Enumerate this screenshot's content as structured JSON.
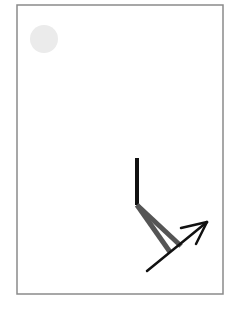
{
  "diagram": {
    "background": "#ffffff",
    "frame": {
      "x": 17,
      "y": 5,
      "width": 206,
      "height": 289,
      "stroke": "#8a8a8a",
      "stroke_width": 1.5
    },
    "sun": {
      "cx": 44,
      "cy": 39,
      "r": 14,
      "fill": "#ebebeb"
    },
    "pole": {
      "x1": 137,
      "y1": 158,
      "x2": 137,
      "y2": 205,
      "stroke": "#111111",
      "width": 4
    },
    "legs": [
      {
        "x1": 137,
        "y1": 205,
        "x2": 170,
        "y2": 252,
        "stroke": "#555555",
        "width": 5
      },
      {
        "x1": 137,
        "y1": 205,
        "x2": 181,
        "y2": 246,
        "stroke": "#555555",
        "width": 5
      }
    ],
    "arrow": {
      "shaft": {
        "x1": 147,
        "y1": 271,
        "x2": 207,
        "y2": 222
      },
      "head_a": {
        "x1": 207,
        "y1": 222,
        "x2": 181,
        "y2": 228
      },
      "head_b": {
        "x1": 207,
        "y1": 222,
        "x2": 196,
        "y2": 244
      },
      "stroke": "#111111",
      "width": 2.5
    }
  }
}
